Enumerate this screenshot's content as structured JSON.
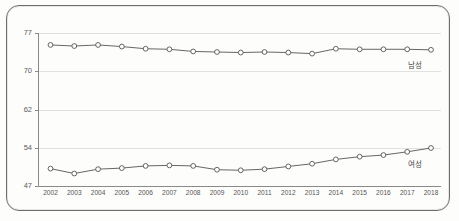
{
  "chart_data": {
    "type": "line",
    "title": "",
    "subtitle": "",
    "xlabel": "",
    "ylabel": "",
    "grid": true,
    "legend_position": "right-inline",
    "categories": [
      "2002",
      "2003",
      "2004",
      "2005",
      "2006",
      "2007",
      "2008",
      "2009",
      "2010",
      "2011",
      "2012",
      "2013",
      "2014",
      "2015",
      "2016",
      "2017",
      "2018"
    ],
    "y_ticks": [
      47,
      54,
      62,
      70,
      77
    ],
    "ylim": [
      47,
      77
    ],
    "xlim": [
      "2002",
      "2018"
    ],
    "series": [
      {
        "name": "남성",
        "label": "남성",
        "color": "#555555",
        "marker": "circle-open",
        "values": [
          74.8,
          74.6,
          74.8,
          74.5,
          74.1,
          74.0,
          73.6,
          73.5,
          73.4,
          73.5,
          73.4,
          73.2,
          74.1,
          74.0,
          74.0,
          74.0,
          73.9
        ]
      },
      {
        "name": "여성",
        "label": "여성",
        "color": "#555555",
        "marker": "circle-open",
        "values": [
          50.2,
          49.3,
          50.1,
          50.3,
          50.7,
          50.8,
          50.7,
          50.0,
          49.9,
          50.1,
          50.6,
          51.1,
          51.9,
          52.4,
          52.7,
          53.3,
          54.0
        ]
      }
    ]
  },
  "axis": {
    "y_tick_labels": [
      "77",
      "70",
      "62",
      "54",
      "47"
    ],
    "x_tick_labels": [
      "2002",
      "2003",
      "2004",
      "2005",
      "2006",
      "2007",
      "2008",
      "2009",
      "2010",
      "2011",
      "2012",
      "2013",
      "2014",
      "2015",
      "2016",
      "2017",
      "2018"
    ]
  },
  "labels": {
    "male": "남성",
    "female": "여성"
  },
  "colors": {
    "line": "#555555",
    "grid": "#d9d9d9",
    "axis": "#8a8a8a",
    "frame": "#6e6e6e",
    "text": "#555555",
    "background": "#fdfdfc"
  }
}
